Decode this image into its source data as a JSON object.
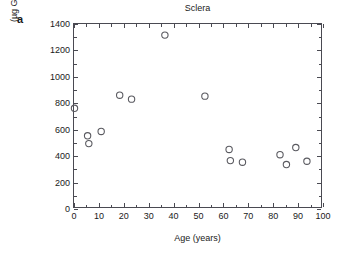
{
  "figure": {
    "panel_letter": "a"
  },
  "chart_data": {
    "type": "scatter",
    "title": "Sclera",
    "xlabel": "Age (years)",
    "ylabel_line1": "Decorin",
    "ylabel_line2": "(µg GAG/g wet wt)",
    "xlim": [
      0,
      100
    ],
    "ylim": [
      0,
      1400
    ],
    "xticks": [
      0,
      10,
      20,
      30,
      40,
      50,
      60,
      70,
      80,
      90,
      100
    ],
    "xticklabels": [
      "0",
      "10",
      "20",
      "30",
      "40",
      "50",
      "60",
      "70",
      "80",
      "90",
      "100"
    ],
    "yticks": [
      0,
      200,
      400,
      600,
      800,
      1000,
      1200,
      1400
    ],
    "yticklabels": [
      "0",
      "200",
      "400",
      "600",
      "800",
      "1000",
      "1200",
      "1400"
    ],
    "x_minor_ticks": [
      5,
      15,
      25,
      35,
      45,
      55,
      65,
      75,
      85,
      95
    ],
    "y_minor_ticks": [
      100,
      300,
      500,
      700,
      900,
      1100,
      1300
    ],
    "grid": false,
    "legend": null,
    "marker": "open-circle",
    "marker_color": "#5a5a60",
    "series": [
      {
        "name": "Decorin",
        "points": [
          {
            "x": 0.2,
            "y": 755
          },
          {
            "x": 5.5,
            "y": 545
          },
          {
            "x": 6.0,
            "y": 485
          },
          {
            "x": 11.0,
            "y": 578
          },
          {
            "x": 18.5,
            "y": 855
          },
          {
            "x": 23.3,
            "y": 825
          },
          {
            "x": 36.8,
            "y": 1315
          },
          {
            "x": 53.0,
            "y": 848
          },
          {
            "x": 62.8,
            "y": 440
          },
          {
            "x": 63.3,
            "y": 355
          },
          {
            "x": 68.2,
            "y": 343
          },
          {
            "x": 83.4,
            "y": 400
          },
          {
            "x": 86.0,
            "y": 325
          },
          {
            "x": 89.8,
            "y": 455
          },
          {
            "x": 94.3,
            "y": 350
          }
        ]
      }
    ]
  }
}
